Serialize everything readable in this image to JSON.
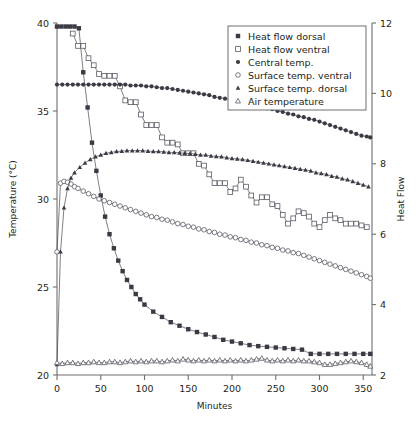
{
  "chart_data": {
    "type": "line",
    "title": "",
    "xlabel": "Minutes",
    "ylabel": "Temperature (°C)",
    "ylabel_right": "Heat Flow",
    "xlim": [
      0,
      360
    ],
    "ylim": [
      20,
      40
    ],
    "ylim_right": [
      2,
      12
    ],
    "xticks": [
      0,
      50,
      100,
      150,
      200,
      250,
      300,
      350
    ],
    "yticks": [
      20,
      25,
      30,
      35,
      40
    ],
    "yticks_right": [
      2,
      4,
      6,
      8,
      10,
      12
    ],
    "grid": false,
    "legend_position": "top-right",
    "series": [
      {
        "name": "Heat flow dorsal",
        "marker": "filled-square",
        "axis": "right",
        "x": [
          0,
          5,
          10,
          15,
          20,
          25,
          30,
          35,
          40,
          45,
          50,
          55,
          60,
          65,
          70,
          75,
          80,
          85,
          90,
          95,
          100,
          110,
          120,
          130,
          140,
          150,
          160,
          170,
          180,
          190,
          200,
          210,
          220,
          230,
          240,
          250,
          260,
          270,
          280,
          290,
          300,
          310,
          320,
          330,
          340,
          350,
          358
        ],
        "values": [
          11.9,
          11.9,
          11.9,
          11.9,
          11.9,
          11.85,
          10.6,
          9.6,
          8.6,
          7.8,
          7.1,
          6.5,
          6.0,
          5.6,
          5.25,
          4.95,
          4.7,
          4.5,
          4.3,
          4.15,
          4.0,
          3.8,
          3.65,
          3.5,
          3.4,
          3.3,
          3.22,
          3.15,
          3.08,
          3.0,
          2.95,
          2.9,
          2.85,
          2.82,
          2.8,
          2.78,
          2.76,
          2.74,
          2.72,
          2.6,
          2.6,
          2.6,
          2.6,
          2.6,
          2.6,
          2.6,
          2.6
        ]
      },
      {
        "name": "Heat flow ventral",
        "marker": "open-square",
        "axis": "right",
        "x": [
          18,
          24,
          30,
          36,
          42,
          48,
          54,
          60,
          66,
          72,
          78,
          84,
          90,
          96,
          102,
          108,
          114,
          120,
          126,
          132,
          138,
          144,
          150,
          156,
          162,
          168,
          174,
          180,
          186,
          192,
          198,
          204,
          210,
          216,
          222,
          228,
          234,
          240,
          246,
          252,
          258,
          264,
          270,
          276,
          282,
          288,
          294,
          300,
          306,
          312,
          318,
          324,
          330,
          336,
          342,
          348,
          354
        ],
        "values": [
          11.7,
          11.35,
          11.35,
          11.0,
          10.8,
          10.55,
          10.5,
          10.5,
          10.5,
          10.2,
          9.8,
          9.75,
          9.75,
          9.4,
          9.1,
          9.1,
          9.1,
          8.75,
          8.6,
          8.6,
          8.55,
          8.3,
          8.3,
          8.3,
          8.0,
          7.95,
          7.7,
          7.45,
          7.45,
          7.45,
          7.2,
          7.3,
          7.55,
          7.35,
          7.1,
          6.9,
          7.05,
          7.05,
          6.85,
          6.8,
          6.55,
          6.3,
          6.45,
          6.65,
          6.6,
          6.5,
          6.3,
          6.2,
          6.4,
          6.55,
          6.45,
          6.4,
          6.3,
          6.3,
          6.3,
          6.25,
          6.2
        ]
      },
      {
        "name": "Central temp.",
        "marker": "filled-circle",
        "axis": "left",
        "x": [
          0,
          6,
          12,
          18,
          24,
          30,
          36,
          42,
          48,
          54,
          60,
          66,
          72,
          78,
          84,
          90,
          96,
          102,
          108,
          114,
          120,
          126,
          132,
          138,
          144,
          150,
          156,
          162,
          168,
          174,
          180,
          186,
          192,
          198,
          204,
          210,
          216,
          222,
          228,
          234,
          240,
          246,
          252,
          258,
          264,
          270,
          276,
          282,
          288,
          294,
          300,
          306,
          312,
          318,
          324,
          330,
          336,
          342,
          348,
          354,
          358
        ],
        "values": [
          36.5,
          36.5,
          36.5,
          36.5,
          36.5,
          36.5,
          36.5,
          36.5,
          36.5,
          36.5,
          36.5,
          36.5,
          36.5,
          36.5,
          36.45,
          36.45,
          36.45,
          36.4,
          36.4,
          36.35,
          36.3,
          36.3,
          36.25,
          36.2,
          36.15,
          36.1,
          36.05,
          36.0,
          35.95,
          35.9,
          35.8,
          35.75,
          35.7,
          35.65,
          35.6,
          35.5,
          35.45,
          35.4,
          35.3,
          35.25,
          35.15,
          35.1,
          35.0,
          34.95,
          34.85,
          34.8,
          34.7,
          34.65,
          34.55,
          34.5,
          34.4,
          34.3,
          34.2,
          34.1,
          34.0,
          33.9,
          33.8,
          33.7,
          33.6,
          33.55,
          33.5
        ]
      },
      {
        "name": "Surface temp. ventral",
        "marker": "open-circle",
        "axis": "left",
        "x": [
          0,
          4,
          8,
          12,
          16,
          20,
          24,
          30,
          36,
          42,
          48,
          54,
          60,
          66,
          72,
          78,
          84,
          90,
          96,
          102,
          108,
          114,
          120,
          126,
          132,
          138,
          144,
          150,
          156,
          162,
          168,
          174,
          180,
          186,
          192,
          198,
          204,
          210,
          216,
          222,
          228,
          234,
          240,
          246,
          252,
          258,
          264,
          270,
          276,
          282,
          288,
          294,
          300,
          306,
          312,
          318,
          324,
          330,
          336,
          342,
          348,
          354,
          358
        ],
        "values": [
          27.0,
          30.9,
          31.0,
          30.95,
          30.85,
          30.7,
          30.6,
          30.45,
          30.3,
          30.15,
          30.0,
          29.9,
          29.8,
          29.7,
          29.6,
          29.5,
          29.4,
          29.3,
          29.2,
          29.1,
          29.0,
          28.95,
          28.85,
          28.8,
          28.7,
          28.6,
          28.55,
          28.45,
          28.4,
          28.3,
          28.25,
          28.15,
          28.1,
          28.0,
          27.95,
          27.85,
          27.8,
          27.7,
          27.65,
          27.55,
          27.5,
          27.4,
          27.35,
          27.25,
          27.2,
          27.1,
          27.05,
          26.95,
          26.9,
          26.8,
          26.7,
          26.6,
          26.5,
          26.4,
          26.3,
          26.2,
          26.1,
          26.0,
          25.9,
          25.8,
          25.7,
          25.6,
          25.5
        ]
      },
      {
        "name": "Surface temp. dorsal",
        "marker": "filled-triangle",
        "axis": "left",
        "x": [
          0,
          4,
          8,
          12,
          16,
          20,
          26,
          32,
          38,
          44,
          50,
          56,
          62,
          68,
          74,
          80,
          86,
          92,
          98,
          104,
          110,
          116,
          122,
          128,
          134,
          140,
          146,
          152,
          158,
          164,
          170,
          176,
          182,
          188,
          194,
          200,
          206,
          212,
          218,
          224,
          230,
          236,
          242,
          248,
          254,
          260,
          266,
          272,
          278,
          284,
          290,
          296,
          302,
          308,
          314,
          320,
          326,
          332,
          338,
          344,
          350,
          356
        ],
        "values": [
          20.6,
          27.0,
          29.5,
          30.6,
          31.2,
          31.5,
          31.8,
          32.05,
          32.25,
          32.4,
          32.5,
          32.6,
          32.65,
          32.7,
          32.72,
          32.75,
          32.75,
          32.75,
          32.75,
          32.72,
          32.7,
          32.7,
          32.68,
          32.65,
          32.65,
          32.62,
          32.6,
          32.58,
          32.55,
          32.5,
          32.5,
          32.45,
          32.42,
          32.4,
          32.35,
          32.3,
          32.28,
          32.25,
          32.2,
          32.15,
          32.1,
          32.05,
          32.0,
          31.95,
          31.9,
          31.85,
          31.8,
          31.75,
          31.7,
          31.65,
          31.6,
          31.5,
          31.45,
          31.4,
          31.3,
          31.25,
          31.15,
          31.1,
          31.0,
          30.9,
          30.8,
          30.7
        ]
      },
      {
        "name": "Air temperature",
        "marker": "open-triangle",
        "axis": "left",
        "x": [
          0,
          6,
          12,
          18,
          24,
          30,
          36,
          42,
          48,
          54,
          60,
          66,
          72,
          78,
          84,
          90,
          96,
          102,
          108,
          114,
          120,
          126,
          132,
          138,
          144,
          150,
          156,
          162,
          168,
          174,
          180,
          186,
          192,
          198,
          204,
          210,
          216,
          222,
          228,
          234,
          240,
          246,
          252,
          258,
          264,
          270,
          276,
          282,
          288,
          294,
          300,
          306,
          312,
          318,
          324,
          330,
          336,
          342,
          348,
          354,
          358
        ],
        "values": [
          20.7,
          20.65,
          20.7,
          20.7,
          20.65,
          20.7,
          20.7,
          20.75,
          20.7,
          20.7,
          20.75,
          20.75,
          20.7,
          20.75,
          20.8,
          20.75,
          20.8,
          20.75,
          20.8,
          20.8,
          20.75,
          20.8,
          20.85,
          20.8,
          20.9,
          20.85,
          20.8,
          20.85,
          20.8,
          20.85,
          20.8,
          20.85,
          20.8,
          20.85,
          20.8,
          20.85,
          20.8,
          20.85,
          20.9,
          20.95,
          20.85,
          20.8,
          20.85,
          20.8,
          20.85,
          20.8,
          20.85,
          20.8,
          20.8,
          20.75,
          20.7,
          20.6,
          20.6,
          20.65,
          20.7,
          20.75,
          20.8,
          20.75,
          20.7,
          20.6,
          20.5
        ]
      }
    ]
  },
  "legend": {
    "items": [
      {
        "label": "Heat flow dorsal",
        "marker": "filled-square"
      },
      {
        "label": "Heat flow ventral",
        "marker": "open-square"
      },
      {
        "label": "Central temp.",
        "marker": "filled-circle"
      },
      {
        "label": "Surface temp. ventral",
        "marker": "open-circle"
      },
      {
        "label": "Surface temp. dorsal",
        "marker": "filled-triangle"
      },
      {
        "label": "Air temperature",
        "marker": "open-triangle"
      }
    ]
  },
  "colors": {
    "axis": "#6d6e71",
    "line": "#3b3b44",
    "marker_fill": "#3a3a45",
    "marker_stroke": "#5a5a66",
    "background": "#ffffff"
  }
}
